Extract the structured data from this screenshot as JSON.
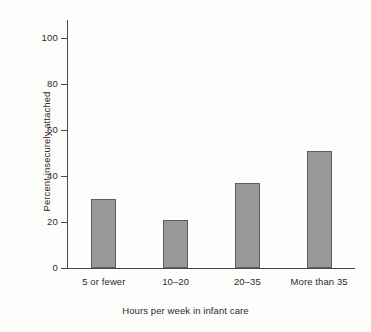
{
  "chart_data": {
    "type": "bar",
    "title": "",
    "subtitle": "",
    "categories": [
      "5 or fewer",
      "10–20",
      "20–35",
      "More than 35"
    ],
    "values": [
      30,
      21,
      37,
      51
    ],
    "xlabel": "Hours per week in infant care",
    "ylabel": "Percent insecurely attached",
    "ylim": [
      0,
      100
    ],
    "yticks": [
      0,
      20,
      40,
      60,
      80,
      100
    ],
    "ytick_labels": [
      "0",
      "20",
      "40",
      "60",
      "80",
      "100"
    ],
    "grid": false,
    "legend": null,
    "annotations": [],
    "colors": {
      "bar_fill": "#989898",
      "bar_edge": "#5d5d5d",
      "axis": "#4a4a4a",
      "text": "#2b2b2b",
      "background": "#fdfdfb"
    }
  }
}
